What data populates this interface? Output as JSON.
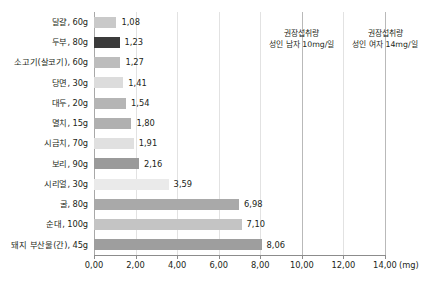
{
  "chart_data": {
    "type": "bar",
    "orientation": "horizontal",
    "title": "",
    "xlabel": "(mg)",
    "ylabel": "",
    "xlim": [
      0,
      14
    ],
    "xtick_step": 2,
    "grid": true,
    "legend": "none",
    "unit_label": "(mg)",
    "categories": [
      "달걀, 60g",
      "두부, 80g",
      "소고기(살코기), 60g",
      "당면, 30g",
      "대두, 20g",
      "멸치, 15g",
      "시금치, 70g",
      "보리, 90g",
      "시리얼, 30g",
      "굴, 80g",
      "순대, 100g",
      "돼지 부산물(간), 45g"
    ],
    "values": [
      1.08,
      1.23,
      1.27,
      1.41,
      1.54,
      1.8,
      1.91,
      2.16,
      3.59,
      6.98,
      7.1,
      8.06
    ],
    "value_labels": [
      "1,08",
      "1,23",
      "1,27",
      "1,41",
      "1,54",
      "1,80",
      "1,91",
      "2,16",
      "3,59",
      "6,98",
      "7,10",
      "8,06"
    ],
    "bar_colors": [
      "#c9c9c9",
      "#3b3b3b",
      "#bdbdbd",
      "#dcdcdc",
      "#b5b5b5",
      "#b0b0b0",
      "#e0e0e0",
      "#9a9a9a",
      "#eaeaea",
      "#a9a9a9",
      "#c4c4c4",
      "#9e9e9e"
    ],
    "xtick_labels": [
      "0,00",
      "2,00",
      "4,00",
      "6,00",
      "8,00",
      "10,00",
      "12,00",
      "14,00"
    ],
    "xtick_values": [
      0,
      2,
      4,
      6,
      8,
      10,
      12,
      14
    ],
    "reference_lines": [
      {
        "value": 10,
        "label_line1": "권장섭취량",
        "label_line2": "성인 남자 10mg/일"
      },
      {
        "value": 14,
        "label_line1": "권장섭취량",
        "label_line2": "성인 여자 14mg/일"
      }
    ],
    "colors": {
      "gridline": "#e2e2e2",
      "reference_line": "#b9b9b9",
      "axis": "#8c8c8c",
      "text": "#231f20",
      "background": "#ffffff"
    }
  }
}
